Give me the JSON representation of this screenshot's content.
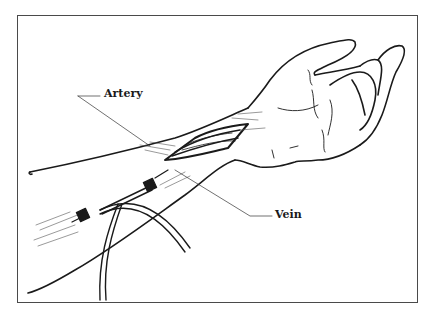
{
  "figure": {
    "labels": {
      "artery": "Artery",
      "vein": "Vein"
    },
    "colors": {
      "ink": "#1a1a1a",
      "frame": "#4a4a4a",
      "background": "#ffffff"
    }
  }
}
